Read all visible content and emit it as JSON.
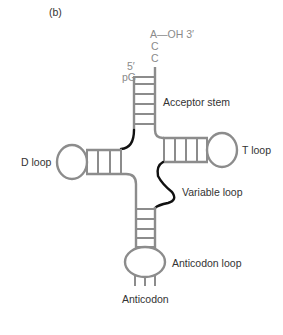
{
  "figure": {
    "panel_label": "(b)",
    "colors": {
      "backbone": "#8c8c8c",
      "highlight_strand": "#111111",
      "sequence_text": "#8a8a8a",
      "label_text": "#333333",
      "background": "#ffffff"
    }
  },
  "sequence": {
    "three_prime_end": "A—OH 3′",
    "c1": "C",
    "c2": "C",
    "five_prime": "5′",
    "pG": "pG"
  },
  "labels": {
    "acceptor_stem": "Acceptor stem",
    "d_loop": "D loop",
    "t_loop": "T loop",
    "variable_loop": "Variable loop",
    "anticodon_loop": "Anticodon loop",
    "anticodon": "Anticodon"
  },
  "structure": {
    "acceptor_stem_base_pairs": 5,
    "d_stem_base_pairs": 3,
    "t_stem_base_pairs": 4,
    "anticodon_stem_base_pairs": 5,
    "anticodon_bases": 3
  }
}
